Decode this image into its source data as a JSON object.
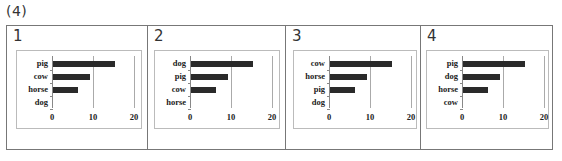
{
  "question_label": "(4)",
  "chart_data": [
    {
      "type": "bar",
      "orientation": "horizontal",
      "title": "1",
      "categories": [
        "pig",
        "cow",
        "horse",
        "dog"
      ],
      "values": [
        15,
        9,
        6,
        0
      ],
      "xlabel": "",
      "ylabel": "",
      "xlim": [
        0,
        20
      ],
      "xticks": [
        "0",
        "10",
        "20"
      ],
      "grid": true
    },
    {
      "type": "bar",
      "orientation": "horizontal",
      "title": "2",
      "categories": [
        "dog",
        "pig",
        "cow",
        "horse"
      ],
      "values": [
        15,
        9,
        6,
        0
      ],
      "xlabel": "",
      "ylabel": "",
      "xlim": [
        0,
        20
      ],
      "xticks": [
        "0",
        "10",
        "20"
      ],
      "grid": true
    },
    {
      "type": "bar",
      "orientation": "horizontal",
      "title": "3",
      "categories": [
        "cow",
        "horse",
        "pig",
        "dog"
      ],
      "values": [
        15,
        9,
        6,
        0
      ],
      "xlabel": "",
      "ylabel": "",
      "xlim": [
        0,
        20
      ],
      "xticks": [
        "0",
        "10",
        "20"
      ],
      "grid": true
    },
    {
      "type": "bar",
      "orientation": "horizontal",
      "title": "4",
      "categories": [
        "pig",
        "dog",
        "horse",
        "cow"
      ],
      "values": [
        15,
        9,
        6,
        0
      ],
      "xlabel": "",
      "ylabel": "",
      "xlim": [
        0,
        20
      ],
      "xticks": [
        "0",
        "10",
        "20"
      ],
      "grid": true
    }
  ],
  "colors": {
    "bar": "#2a2a2a",
    "frame": "#777777",
    "plot_border": "#bbbbbb",
    "grid": "#aaaaaa"
  }
}
